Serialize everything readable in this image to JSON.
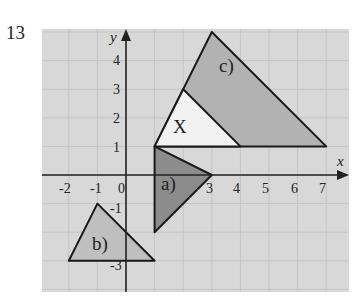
{
  "question_number": "13",
  "axes": {
    "x_label": "x",
    "y_label": "y",
    "x_ticks": [
      "-2",
      "-1",
      "0",
      "3",
      "4",
      "5",
      "6",
      "7"
    ],
    "y_ticks": [
      "4",
      "3",
      "2",
      "1",
      "-1",
      "-3"
    ],
    "x_range": [
      -3,
      7.9
    ],
    "y_range": [
      -4,
      5
    ]
  },
  "shapes": [
    {
      "label": "c)",
      "vertices": [
        [
          1,
          1
        ],
        [
          3,
          5
        ],
        [
          7,
          1
        ]
      ],
      "fill": "#b2b2b2"
    },
    {
      "label": "X",
      "vertices": [
        [
          1,
          1
        ],
        [
          2,
          3
        ],
        [
          4,
          1
        ]
      ],
      "fill": "#f2f2f2"
    },
    {
      "label": "a)",
      "vertices": [
        [
          1,
          1
        ],
        [
          3,
          0
        ],
        [
          1,
          -2
        ]
      ],
      "fill": "#8c8c8c"
    },
    {
      "label": "b)",
      "vertices": [
        [
          -1,
          -1
        ],
        [
          -2,
          -3
        ],
        [
          1,
          -3
        ]
      ],
      "fill": "#bfbfbf"
    }
  ],
  "colors": {
    "grid_bg": "#d8d8d8",
    "grid_line": "#c4c4c4",
    "axis": "#222222"
  }
}
